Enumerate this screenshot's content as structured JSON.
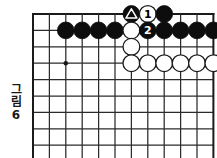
{
  "figure": {
    "caption_vertical": [
      "그",
      "림"
    ],
    "caption_number": "6",
    "caption_full": "그림 6"
  },
  "board": {
    "type": "go-board-diagram",
    "grid_spacing": 16.4,
    "origin_x": 33,
    "origin_y": 14,
    "cols": 11,
    "rows": 9,
    "line_color": "#2b2b2b",
    "border_color": "#1a1a1a",
    "stone_radius": 8.4,
    "black_color": "#0d0d0d",
    "white_color": "#ffffff",
    "star_points": [
      {
        "col": 2,
        "row": 3
      }
    ],
    "stones": [
      {
        "col": 6,
        "row": 0,
        "color": "black",
        "mark": "triangle",
        "label": ""
      },
      {
        "col": 7,
        "row": 0,
        "color": "white",
        "mark": "number",
        "label": "1"
      },
      {
        "col": 8,
        "row": 0,
        "color": "black",
        "mark": "",
        "label": ""
      },
      {
        "col": 2,
        "row": 1,
        "color": "black",
        "mark": "",
        "label": ""
      },
      {
        "col": 3,
        "row": 1,
        "color": "black",
        "mark": "",
        "label": ""
      },
      {
        "col": 4,
        "row": 1,
        "color": "black",
        "mark": "",
        "label": ""
      },
      {
        "col": 5,
        "row": 1,
        "color": "black",
        "mark": "",
        "label": ""
      },
      {
        "col": 6,
        "row": 1,
        "color": "white",
        "mark": "",
        "label": ""
      },
      {
        "col": 7,
        "row": 1,
        "color": "black",
        "mark": "number",
        "label": "2"
      },
      {
        "col": 8,
        "row": 1,
        "color": "black",
        "mark": "",
        "label": ""
      },
      {
        "col": 9,
        "row": 1,
        "color": "black",
        "mark": "",
        "label": ""
      },
      {
        "col": 10,
        "row": 1,
        "color": "black",
        "mark": "",
        "label": ""
      },
      {
        "col": 11,
        "row": 1,
        "color": "black",
        "mark": "",
        "label": ""
      },
      {
        "col": 6,
        "row": 2,
        "color": "white",
        "mark": "",
        "label": ""
      },
      {
        "col": 6,
        "row": 3,
        "color": "white",
        "mark": "",
        "label": ""
      },
      {
        "col": 7,
        "row": 3,
        "color": "white",
        "mark": "",
        "label": ""
      },
      {
        "col": 8,
        "row": 3,
        "color": "white",
        "mark": "",
        "label": ""
      },
      {
        "col": 9,
        "row": 3,
        "color": "white",
        "mark": "",
        "label": ""
      },
      {
        "col": 10,
        "row": 3,
        "color": "white",
        "mark": "",
        "label": ""
      },
      {
        "col": 11,
        "row": 3,
        "color": "white",
        "mark": "",
        "label": ""
      }
    ]
  }
}
